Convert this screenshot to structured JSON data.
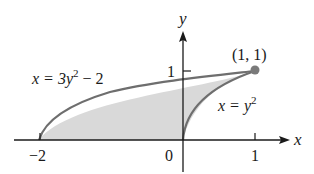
{
  "figure": {
    "axes": {
      "x_label": "x",
      "y_label": "y",
      "x_ticks": [
        {
          "value": -2,
          "label": "−2"
        },
        {
          "value": 0,
          "label": "0"
        },
        {
          "value": 1,
          "label": "1"
        }
      ],
      "y_ticks": [
        {
          "value": 1,
          "label": "1"
        }
      ]
    },
    "curves": [
      {
        "name": "left-parabola",
        "equation_lhs": "x = 3y",
        "exponent": "2",
        "equation_rhs": " − 2"
      },
      {
        "name": "right-parabola",
        "equation_lhs": "x = y",
        "exponent": "2"
      }
    ],
    "point": {
      "label": "(1, 1)",
      "x": 1,
      "y": 1
    },
    "region": {
      "fill": "#d9d9d9",
      "description": "region bounded between x = 3y^2 - 2 and x = y^2 for 0 ≤ y ≤ 1"
    },
    "colors": {
      "curve": "#6e6e6e",
      "axis": "#1a1a1a",
      "fill": "#d9d9d9",
      "point": "#7a7a7a"
    }
  }
}
